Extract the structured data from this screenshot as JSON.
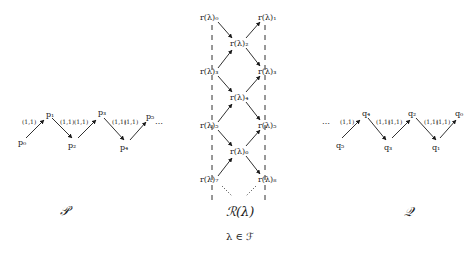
{
  "diagram": {
    "left": {
      "caption": "𝒫",
      "nodes": [
        "p₀",
        "p₁",
        "p₂",
        "p₃",
        "p₄",
        "p₅"
      ],
      "edge_labels": [
        "(1,1)",
        "(1,1)",
        "(1,1)",
        "(1,1)",
        "(1,1)"
      ],
      "ellipsis": "⋯"
    },
    "middle": {
      "caption": "ℛ(λ)",
      "subcaption": "λ ∈ ℱ",
      "nodes": [
        "r(λ)₀",
        "r(λ)₁",
        "r(λ)₂",
        "r(λ)₃",
        "r(λ)₃",
        "r(λ)₄",
        "r(λ)₅",
        "r(λ)₅",
        "r(λ)₆",
        "r(λ)₇",
        "r(λ)₈"
      ],
      "ellipsis": "⋮"
    },
    "right": {
      "caption": "𝒬",
      "nodes": [
        "q₅",
        "q₄",
        "q₃",
        "q₂",
        "q₁",
        "q₀"
      ],
      "edge_labels": [
        "(1,1)",
        "(1,1)",
        "(1,1)",
        "(1,1)",
        "(1,1)"
      ],
      "ellipsis": "⋯"
    },
    "colors": {
      "ink": "#1a1a1a",
      "background": "#ffffff"
    }
  }
}
